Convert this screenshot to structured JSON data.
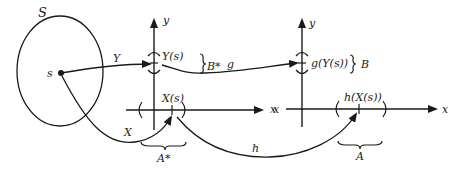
{
  "diagram": {
    "sample_space": {
      "label": "S",
      "point_label": "s"
    },
    "maps": {
      "Y": "Y",
      "X": "X",
      "g": "g",
      "h": "h"
    },
    "left_axes": {
      "y_axis_label": "y",
      "x_axis_label": "x",
      "y_point_label": "Y(s)",
      "x_point_label": "X(s)",
      "y_set_label": "B*",
      "x_set_label": "A*"
    },
    "right_axes": {
      "y_axis_label": "y",
      "x_axis_label": "x",
      "y_point_label": "g(Y(s))",
      "x_point_label": "h(X(s))",
      "y_set_label": "B",
      "x_set_label": "A"
    }
  }
}
